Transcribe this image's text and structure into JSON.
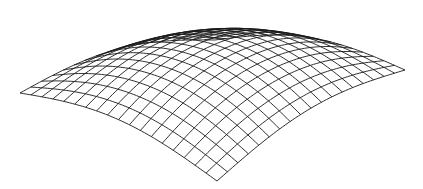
{
  "figure": {
    "type": "wireframe-surface",
    "line_color": "#1a1a1a",
    "background": "#ffffff",
    "divisions": 18,
    "corners": {
      "front": [
        217,
        181
      ],
      "left": [
        20,
        93
      ],
      "right": [
        405,
        70
      ],
      "back": [
        215,
        40
      ]
    },
    "dome_lift": 62,
    "edge_sag": 0
  }
}
